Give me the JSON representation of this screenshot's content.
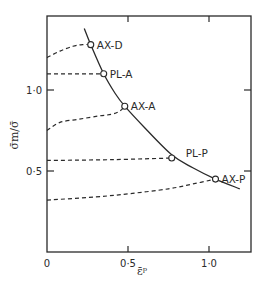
{
  "chart_data": {
    "type": "line",
    "title": "",
    "xlabel": "ε̄ᵖ",
    "ylabel": "σ̄m/σ̄",
    "xlim": [
      0,
      1.25
    ],
    "ylim": [
      0,
      1.45
    ],
    "grid": false,
    "legend": "none",
    "x_ticks": [
      {
        "value": 0,
        "label": "0"
      },
      {
        "value": 0.5,
        "label": "0·5"
      },
      {
        "value": 1.0,
        "label": "1·0"
      }
    ],
    "y_ticks": [
      {
        "value": 0.5,
        "label": "0·5"
      },
      {
        "value": 1.0,
        "label": "1·0"
      }
    ],
    "limit_curve": {
      "name": "limit curve",
      "style": "solid",
      "points": [
        [
          0.23,
          1.38
        ],
        [
          0.27,
          1.28
        ],
        [
          0.35,
          1.1
        ],
        [
          0.42,
          0.98
        ],
        [
          0.48,
          0.9
        ],
        [
          0.6,
          0.77
        ],
        [
          0.77,
          0.6
        ],
        [
          0.9,
          0.52
        ],
        [
          1.04,
          0.45
        ],
        [
          1.19,
          0.39
        ]
      ]
    },
    "series": [
      {
        "name": "AX-D",
        "style": "dashed",
        "points": [
          [
            0.0,
            1.2
          ],
          [
            0.08,
            1.24
          ],
          [
            0.16,
            1.27
          ],
          [
            0.22,
            1.28
          ],
          [
            0.27,
            1.28
          ]
        ]
      },
      {
        "name": "PL-A",
        "style": "dashed",
        "points": [
          [
            0.0,
            1.1
          ],
          [
            0.35,
            1.1
          ]
        ]
      },
      {
        "name": "AX-A",
        "style": "dashed",
        "points": [
          [
            0.0,
            0.75
          ],
          [
            0.08,
            0.8
          ],
          [
            0.2,
            0.82
          ],
          [
            0.32,
            0.84
          ],
          [
            0.4,
            0.85
          ],
          [
            0.45,
            0.87
          ],
          [
            0.48,
            0.9
          ]
        ]
      },
      {
        "name": "PL-P",
        "style": "dashed",
        "points": [
          [
            0.0,
            0.565
          ],
          [
            0.4,
            0.57
          ],
          [
            0.77,
            0.58
          ]
        ]
      },
      {
        "name": "AX-P",
        "style": "dashed",
        "points": [
          [
            0.0,
            0.32
          ],
          [
            0.3,
            0.34
          ],
          [
            0.51,
            0.36
          ],
          [
            0.75,
            0.39
          ],
          [
            0.9,
            0.42
          ],
          [
            1.04,
            0.45
          ]
        ]
      }
    ],
    "markers": [
      {
        "label": "AX-D",
        "x": 0.27,
        "y": 1.28
      },
      {
        "label": "PL-A",
        "x": 0.35,
        "y": 1.1
      },
      {
        "label": "AX-A",
        "x": 0.48,
        "y": 0.9
      },
      {
        "label": "PL-P",
        "x": 0.77,
        "y": 0.58
      },
      {
        "label": "AX-P",
        "x": 1.04,
        "y": 0.45
      }
    ]
  }
}
